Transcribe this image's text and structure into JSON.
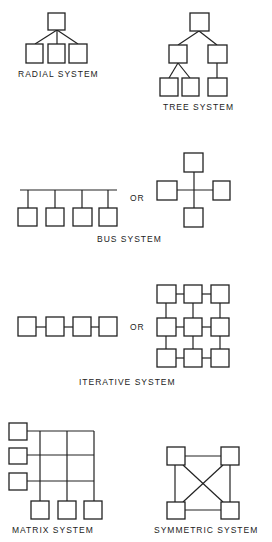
{
  "diagrams": {
    "radial": {
      "label": "RADIAL SYSTEM"
    },
    "tree": {
      "label": "TREE SYSTEM"
    },
    "bus": {
      "label": "BUS SYSTEM",
      "or_label": "OR"
    },
    "iterative": {
      "label": "ITERATIVE SYSTEM",
      "or_label": "OR"
    },
    "matrix": {
      "label": "MATRIX SYSTEM"
    },
    "symmetric": {
      "label": "SYMMETRIC SYSTEM"
    }
  },
  "colors": {
    "stroke": "#222222",
    "background": "#ffffff"
  }
}
